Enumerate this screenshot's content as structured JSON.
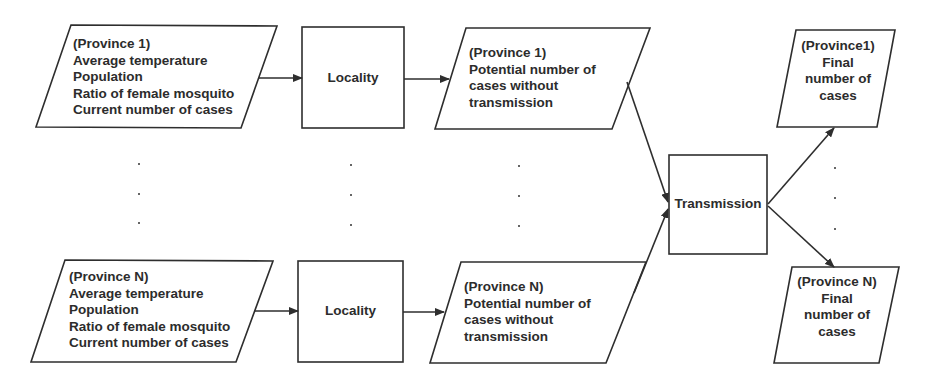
{
  "diagram": {
    "inputs": [
      {
        "lines": [
          "(Province 1)",
          "Average temperature",
          "Population",
          "Ratio of female mosquito",
          "Current number of cases"
        ]
      },
      {
        "lines": [
          "(Province N)",
          "Average temperature",
          "Population",
          "Ratio of female mosquito",
          "Current number of cases"
        ]
      }
    ],
    "locality": [
      {
        "label": "Locality"
      },
      {
        "label": "Locality"
      }
    ],
    "potential": [
      {
        "lines": [
          "(Province 1)",
          "Potential number of",
          "cases without",
          "transmission"
        ]
      },
      {
        "lines": [
          "(Province N)",
          "Potential number of",
          "cases without",
          "transmission"
        ]
      }
    ],
    "transmission": {
      "label": "Transmission"
    },
    "final": [
      {
        "lines": [
          "(Province1)",
          "Final",
          "number of",
          "cases"
        ]
      },
      {
        "lines": [
          "(Province N)",
          "Final",
          "number of",
          "cases"
        ]
      }
    ],
    "ellipsis": "⋮",
    "colors": {
      "stroke": "#2e2e2e",
      "text": "#2c2c2c",
      "background": "#ffffff"
    }
  }
}
